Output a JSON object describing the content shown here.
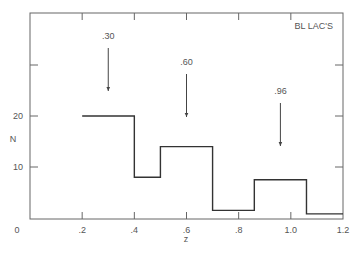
{
  "chart_data": {
    "type": "histogram",
    "title": "BL LAC'S",
    "xlabel": "z",
    "ylabel": "N",
    "xlim": [
      0,
      1.2
    ],
    "ylim": [
      0,
      38
    ],
    "xticks": [
      0,
      0.2,
      0.4,
      0.6,
      0.8,
      1.0,
      1.2
    ],
    "xtick_labels": [
      "0",
      ".2",
      ".4",
      ".6",
      ".8",
      "1.0",
      "1.2"
    ],
    "yticks": [
      10,
      20
    ],
    "ytick_labels": [
      "10",
      "20"
    ],
    "bins": [
      {
        "x0": 0.2,
        "x1": 0.4,
        "value": 20
      },
      {
        "x0": 0.4,
        "x1": 0.5,
        "value": 8
      },
      {
        "x0": 0.5,
        "x1": 0.7,
        "value": 14
      },
      {
        "x0": 0.7,
        "x1": 0.86,
        "value": 1.5
      },
      {
        "x0": 0.86,
        "x1": 1.06,
        "value": 7.5
      },
      {
        "x0": 1.06,
        "x1": 1.2,
        "value": 0.8
      }
    ],
    "annotations": [
      {
        "text": ".30",
        "x": 0.3,
        "arrow": true
      },
      {
        "text": ".60",
        "x": 0.6,
        "arrow": true
      },
      {
        "text": ".96",
        "x": 0.96,
        "arrow": true
      }
    ],
    "grid": false,
    "legend": "none"
  }
}
